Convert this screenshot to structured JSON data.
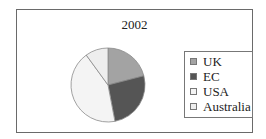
{
  "chart_data": {
    "type": "pie",
    "title": "2002",
    "categories": [
      "UK",
      "EC",
      "USA",
      "Australia"
    ],
    "values": [
      21,
      26,
      43,
      10
    ],
    "colors": [
      "#a3a3a3",
      "#555555",
      "#f4f4f4",
      "#eeeeee"
    ],
    "start_angle": "12 o'clock, clockwise",
    "legend_position": "right",
    "xlabel": "",
    "ylabel": ""
  },
  "legend": {
    "items": [
      {
        "label": "UK",
        "color": "#a3a3a3"
      },
      {
        "label": "EC",
        "color": "#555555"
      },
      {
        "label": "USA",
        "color": "#f4f4f4"
      },
      {
        "label": "Australia",
        "color": "#eeeeee"
      }
    ]
  }
}
